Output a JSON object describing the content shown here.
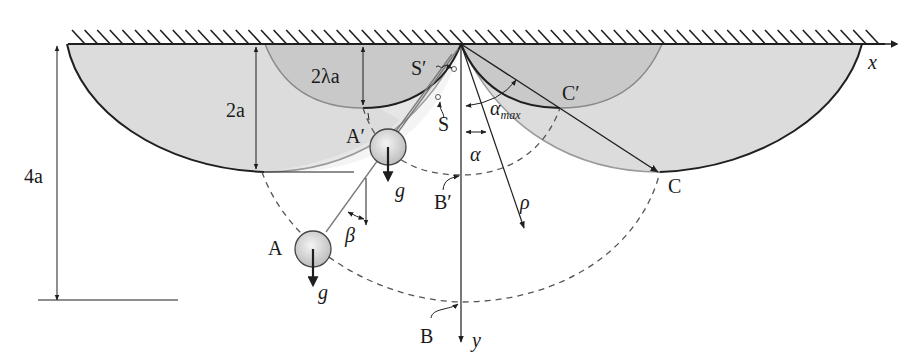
{
  "figure": {
    "colors": {
      "stroke": "#1f1f1f",
      "fill_outer": "#d9d9d9",
      "fill_inner": "#cccccc",
      "bob_fill": "#d4d4d4",
      "dashed": "#555555"
    }
  },
  "labels": {
    "x_axis": "x",
    "y_axis": "y",
    "depth_outer": "2a",
    "depth_inner": "2λa",
    "total_height": "4a",
    "point_S_prime": "S′",
    "point_S": "S",
    "point_A_prime": "A′",
    "point_A": "A",
    "point_B_prime": "B′",
    "point_B": "B",
    "point_C_prime": "C′",
    "point_C": "C",
    "gravity_1": "g",
    "gravity_2": "g",
    "angle_alpha": "α",
    "angle_alpha_max": "α",
    "angle_alpha_max_sub": "max",
    "angle_beta": "β",
    "radius_rho": "ρ"
  }
}
